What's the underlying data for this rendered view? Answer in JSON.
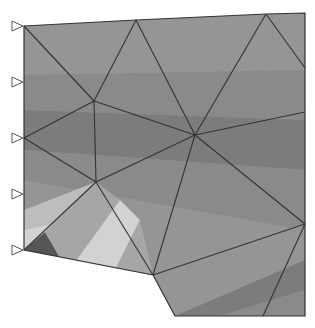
{
  "diagram": {
    "type": "finite-element-mesh",
    "colors": {
      "background": "#ffffff",
      "edge": "#333333",
      "support": "#555555",
      "shades": [
        "#555555",
        "#6a6a6a",
        "#7c7c7c",
        "#8a8a8a",
        "#959595",
        "#a6a6a6",
        "#bdbdbd",
        "#d2d2d2"
      ]
    },
    "outline": [
      [
        24,
        26
      ],
      [
        136,
        20
      ],
      [
        266,
        14
      ],
      [
        305,
        13
      ],
      [
        305,
        316
      ],
      [
        175,
        316
      ],
      [
        153,
        275
      ],
      [
        24,
        250
      ]
    ],
    "nodes": [
      {
        "id": "n1",
        "x": 24,
        "y": 26
      },
      {
        "id": "n2",
        "x": 136,
        "y": 20
      },
      {
        "id": "n3",
        "x": 266,
        "y": 14
      },
      {
        "id": "n4",
        "x": 305,
        "y": 68
      },
      {
        "id": "n5",
        "x": 94,
        "y": 101
      },
      {
        "id": "n6",
        "x": 195,
        "y": 135
      },
      {
        "id": "n7",
        "x": 305,
        "y": 112
      },
      {
        "id": "n8",
        "x": 24,
        "y": 138
      },
      {
        "id": "n9",
        "x": 96,
        "y": 182
      },
      {
        "id": "n10",
        "x": 305,
        "y": 224
      },
      {
        "id": "n11",
        "x": 24,
        "y": 250
      },
      {
        "id": "n12",
        "x": 153,
        "y": 275
      },
      {
        "id": "n13",
        "x": 263,
        "y": 316
      }
    ],
    "edges": [
      [
        "n1",
        "n5"
      ],
      [
        "n2",
        "n5"
      ],
      [
        "n2",
        "n6"
      ],
      [
        "n3",
        "n6"
      ],
      [
        "n3",
        "n4"
      ],
      [
        "n5",
        "n6"
      ],
      [
        "n6",
        "n7"
      ],
      [
        "n5",
        "n8"
      ],
      [
        "n5",
        "n9"
      ],
      [
        "n8",
        "n9"
      ],
      [
        "n9",
        "n6"
      ],
      [
        "n9",
        "n11"
      ],
      [
        "n9",
        "n12"
      ],
      [
        "n6",
        "n12"
      ],
      [
        "n6",
        "n10"
      ],
      [
        "n12",
        "n10"
      ],
      [
        "n10",
        "n13"
      ]
    ],
    "supports": [
      {
        "x": 24,
        "y": 26
      },
      {
        "x": 24,
        "y": 82
      },
      {
        "x": 24,
        "y": 138
      },
      {
        "x": 24,
        "y": 194
      },
      {
        "x": 24,
        "y": 250
      }
    ],
    "bands": [
      {
        "points": [
          [
            24,
            26
          ],
          [
            305,
            13
          ],
          [
            305,
            70
          ],
          [
            24,
            75
          ]
        ],
        "shade": 4
      },
      {
        "points": [
          [
            24,
            75
          ],
          [
            305,
            70
          ],
          [
            305,
            120
          ],
          [
            24,
            110
          ]
        ],
        "shade": 3
      },
      {
        "points": [
          [
            24,
            110
          ],
          [
            305,
            120
          ],
          [
            305,
            170
          ],
          [
            24,
            150
          ]
        ],
        "shade": 2
      },
      {
        "points": [
          [
            24,
            150
          ],
          [
            305,
            170
          ],
          [
            305,
            230
          ],
          [
            24,
            180
          ]
        ],
        "shade": 3
      },
      {
        "points": [
          [
            24,
            180
          ],
          [
            110,
            205
          ],
          [
            24,
            210
          ]
        ],
        "shade": 4
      },
      {
        "points": [
          [
            24,
            210
          ],
          [
            96,
            182
          ],
          [
            60,
            222
          ],
          [
            24,
            230
          ]
        ],
        "shade": 6
      },
      {
        "points": [
          [
            24,
            230
          ],
          [
            60,
            222
          ],
          [
            40,
            250
          ],
          [
            24,
            250
          ]
        ],
        "shade": 7
      },
      {
        "points": [
          [
            24,
            250
          ],
          [
            45,
            232
          ],
          [
            60,
            258
          ]
        ],
        "shade": 0
      },
      {
        "points": [
          [
            45,
            232
          ],
          [
            96,
            182
          ],
          [
            120,
            200
          ],
          [
            75,
            262
          ],
          [
            60,
            258
          ]
        ],
        "shade": 5
      },
      {
        "points": [
          [
            75,
            262
          ],
          [
            120,
            200
          ],
          [
            140,
            220
          ],
          [
            115,
            270
          ]
        ],
        "shade": 7
      },
      {
        "points": [
          [
            115,
            270
          ],
          [
            140,
            220
          ],
          [
            153,
            275
          ]
        ],
        "shade": 5
      },
      {
        "points": [
          [
            153,
            275
          ],
          [
            305,
            224
          ],
          [
            305,
            260
          ],
          [
            175,
            316
          ]
        ],
        "shade": 4
      },
      {
        "points": [
          [
            175,
            316
          ],
          [
            305,
            260
          ],
          [
            305,
            290
          ],
          [
            220,
            316
          ]
        ],
        "shade": 2
      },
      {
        "points": [
          [
            220,
            316
          ],
          [
            305,
            290
          ],
          [
            305,
            316
          ]
        ],
        "shade": 3
      }
    ]
  }
}
